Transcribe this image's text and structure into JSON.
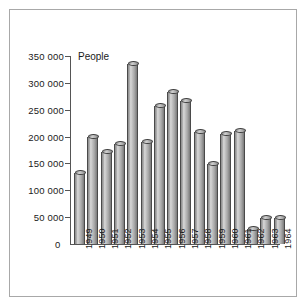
{
  "chart_data": {
    "type": "bar",
    "title": "",
    "subtitle": "",
    "xlabel": "",
    "ylabel": "People",
    "ylim": [
      0,
      350000
    ],
    "ytick_values": [
      0,
      50000,
      100000,
      150000,
      200000,
      250000,
      300000,
      350000
    ],
    "ytick_labels": [
      "0",
      "50 000",
      "100 000",
      "150 000",
      "200 000",
      "250 000",
      "300 000",
      "350 000"
    ],
    "grid": false,
    "legend": "none",
    "thousands_separator": "space",
    "bar_style": "3d-cylinder",
    "bar_color": "#b0b0b0",
    "categories": [
      "1949",
      "1950",
      "1951",
      "1952",
      "1953",
      "1954",
      "1955",
      "1956",
      "1957",
      "1958",
      "1959",
      "1960",
      "1961",
      "1962",
      "1963",
      "1964"
    ],
    "values": [
      132000,
      199000,
      172000,
      187000,
      335000,
      190000,
      256000,
      283000,
      266000,
      208000,
      149000,
      204000,
      211000,
      27000,
      49000,
      48000
    ]
  },
  "colors": {
    "axis": "#555555",
    "frame": "#a8a8a8",
    "text": "#1a1a1a",
    "background": "#ffffff"
  }
}
